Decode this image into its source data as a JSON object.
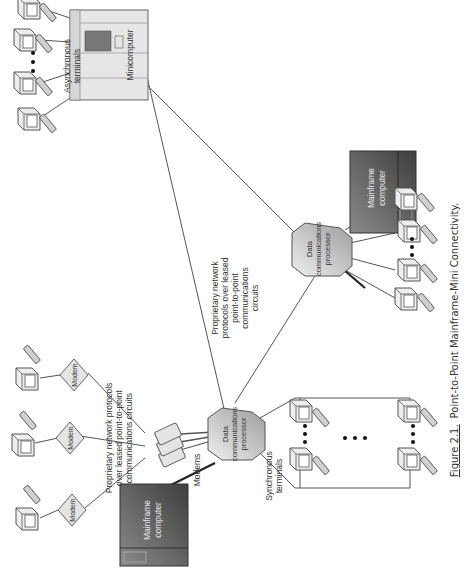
{
  "caption": {
    "figure_label": "Figure 2.1.",
    "title": "Point-to-Point Mainframe-Mini Connectivity."
  },
  "nodes": {
    "minicomputer": {
      "label": "Minicomputer"
    },
    "mainframe_left": {
      "line1": "Mainframe",
      "line2": "computer"
    },
    "mainframe_right": {
      "line1": "Mainframe",
      "line2": "computer"
    },
    "dcp_left": {
      "line1": "Data",
      "line2": "communications",
      "line3": "processor"
    },
    "dcp_right": {
      "line1": "Data",
      "line2": "communications",
      "line3": "processor"
    },
    "modem_1": {
      "label": "Modem"
    },
    "modem_2": {
      "label": "Modem"
    },
    "modem_3": {
      "label": "Modem"
    }
  },
  "labels": {
    "async_terminals": {
      "line1": "Asynchronous",
      "line2": "terminals"
    },
    "sync_terminals": {
      "line1": "Synchronous",
      "line2": "terminals"
    },
    "modems": "Modems",
    "proprietary_modem": {
      "line1": "Proprietary network protocols",
      "line2": "over leased point-to-point",
      "line3": "communications circuits"
    },
    "proprietary_center": {
      "line1": "Proprietary network",
      "line2": "protocols over leased",
      "line3": "point-to-point",
      "line4": "communications",
      "line5": "circuits"
    }
  },
  "colors": {
    "line": "#555555",
    "mainframe_dark": "#5a5a5a",
    "mainframe_light": "#9a9a9a",
    "device_fill": "#e4e4e4",
    "text": "#333333"
  }
}
